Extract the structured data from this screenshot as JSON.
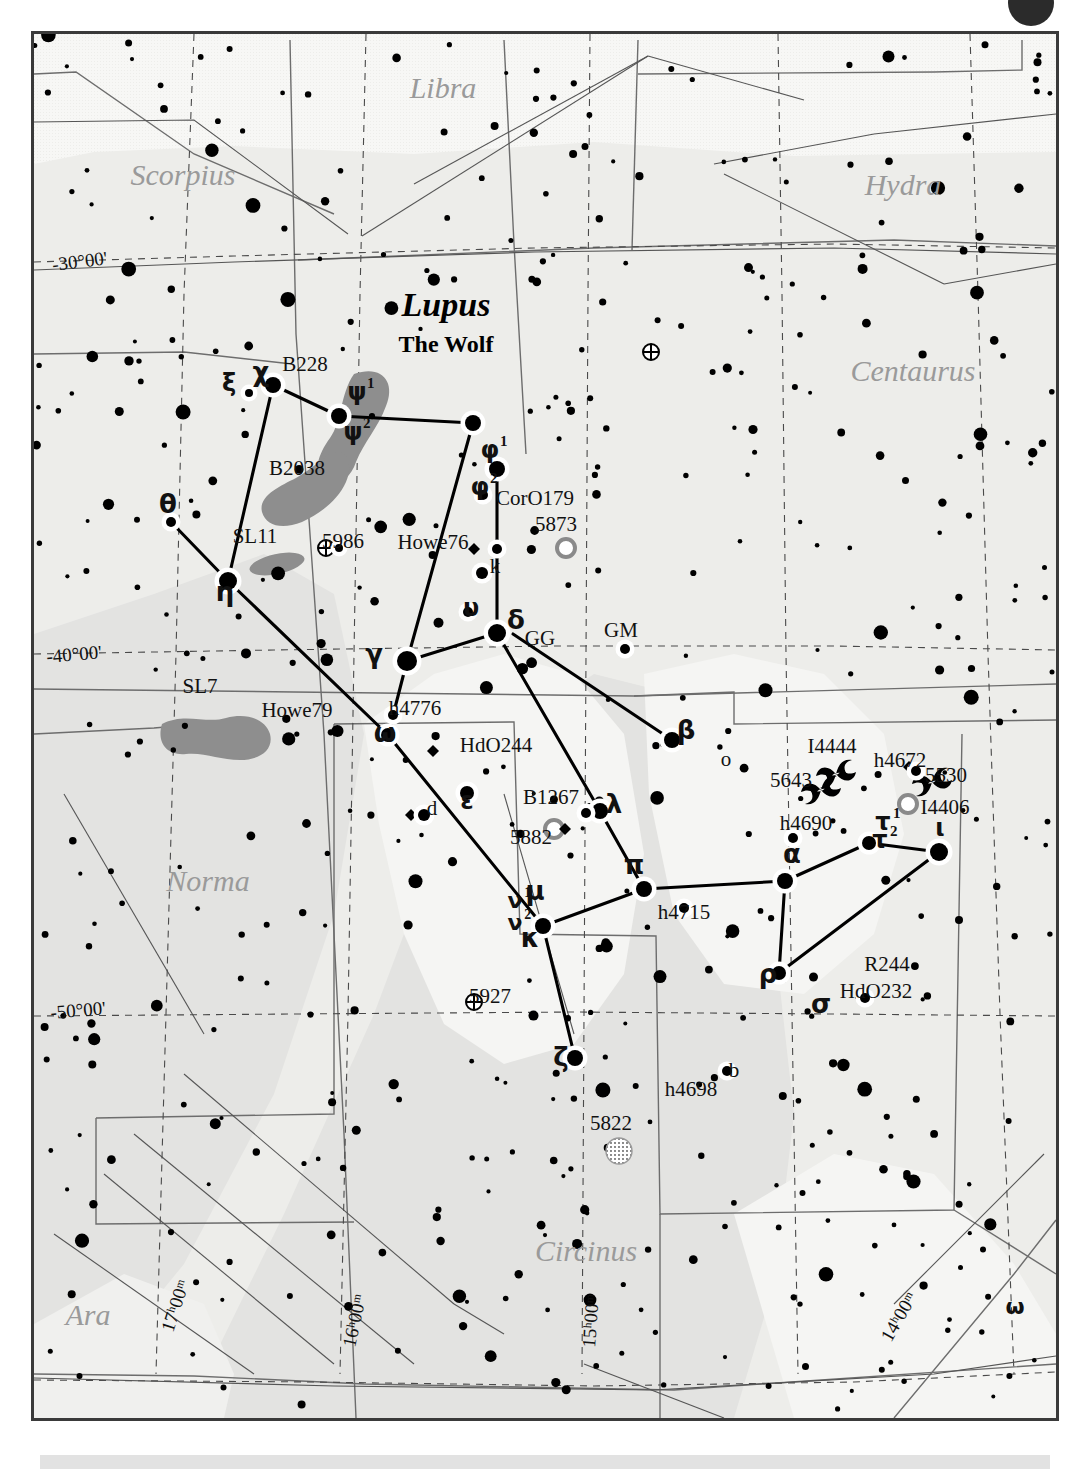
{
  "chart": {
    "title": "Lupus",
    "subtitle": "The Wolf",
    "neighbors": [
      {
        "name": "Libra",
        "x": 440,
        "y": 95,
        "size": 30
      },
      {
        "name": "Scorpius",
        "x": 180,
        "y": 182,
        "size": 30
      },
      {
        "name": "Hydra",
        "x": 900,
        "y": 192,
        "size": 30
      },
      {
        "name": "Centaurus",
        "x": 910,
        "y": 378,
        "size": 30
      },
      {
        "name": "Norma",
        "x": 205,
        "y": 888,
        "size": 30
      },
      {
        "name": "Circinus",
        "x": 583,
        "y": 1258,
        "size": 30
      },
      {
        "name": "Ara",
        "x": 85,
        "y": 1322,
        "size": 30
      },
      {
        "name": "Lupus",
        "x": 0,
        "y": 0,
        "size": 0
      }
    ],
    "coord_labels": [
      {
        "text": "-30°00'",
        "x": 50,
        "y": 268,
        "rot": -7
      },
      {
        "text": "-40°00'",
        "x": 44,
        "y": 660,
        "rot": -5
      },
      {
        "text": "-50°00'",
        "x": 48,
        "y": 1016,
        "rot": -5
      },
      {
        "text": "-60°00'",
        "x": 52,
        "y": 1432,
        "rot": -5
      },
      {
        "text": "17ʰ00ᵐ",
        "x": 170,
        "y": 1330,
        "rot": -72
      },
      {
        "text": "16ʰ00ᵐ",
        "x": 352,
        "y": 1345,
        "rot": -78
      },
      {
        "text": "15ʰ00ᵐ",
        "x": 592,
        "y": 1345,
        "rot": -86
      },
      {
        "text": "14ʰ00ᵐ",
        "x": 888,
        "y": 1340,
        "rot": -60
      }
    ],
    "star_labels": [
      {
        "t": "χ",
        "x": 258,
        "y": 378,
        "k": "g",
        "s": 26
      },
      {
        "t": "ξ",
        "x": 226,
        "y": 388,
        "k": "g",
        "s": 24
      },
      {
        "t": "ψ",
        "x": 354,
        "y": 397,
        "k": "g",
        "s": 24,
        "sup": "1"
      },
      {
        "t": "ψ",
        "x": 350,
        "y": 437,
        "k": "g",
        "s": 24,
        "sup": "2"
      },
      {
        "t": "B228",
        "x": 302,
        "y": 368,
        "k": "t",
        "s": 21
      },
      {
        "t": "B2038",
        "x": 294,
        "y": 472,
        "k": "t",
        "s": 21
      },
      {
        "t": "θ",
        "x": 165,
        "y": 510,
        "k": "g",
        "s": 26
      },
      {
        "t": "SL11",
        "x": 252,
        "y": 540,
        "k": "t",
        "s": 21
      },
      {
        "t": "5986",
        "x": 340,
        "y": 545,
        "k": "t",
        "s": 21
      },
      {
        "t": "η",
        "x": 222,
        "y": 598,
        "k": "g",
        "s": 26
      },
      {
        "t": "SL7",
        "x": 197,
        "y": 690,
        "k": "t",
        "s": 21
      },
      {
        "t": "φ",
        "x": 487,
        "y": 455,
        "k": "g",
        "s": 24,
        "sup": "1"
      },
      {
        "t": "φ",
        "x": 477,
        "y": 492,
        "k": "g",
        "s": 24,
        "sup": "2"
      },
      {
        "t": "CorO179",
        "x": 532,
        "y": 502,
        "k": "t",
        "s": 21
      },
      {
        "t": "5873",
        "x": 553,
        "y": 528,
        "k": "t",
        "s": 21
      },
      {
        "t": "Howe76",
        "x": 430,
        "y": 546,
        "k": "t",
        "s": 21
      },
      {
        "t": "k",
        "x": 492,
        "y": 570,
        "k": "t",
        "s": 21
      },
      {
        "t": "υ",
        "x": 468,
        "y": 613,
        "k": "g",
        "s": 24
      },
      {
        "t": "δ",
        "x": 513,
        "y": 626,
        "k": "g",
        "s": 26
      },
      {
        "t": "GG",
        "x": 537,
        "y": 642,
        "k": "t",
        "s": 21
      },
      {
        "t": "GM",
        "x": 618,
        "y": 634,
        "k": "t",
        "s": 21
      },
      {
        "t": "γ",
        "x": 371,
        "y": 660,
        "k": "g",
        "s": 26
      },
      {
        "t": "h4776",
        "x": 412,
        "y": 712,
        "k": "t",
        "s": 21
      },
      {
        "t": "Howe79",
        "x": 294,
        "y": 714,
        "k": "t",
        "s": 21
      },
      {
        "t": "ω",
        "x": 382,
        "y": 739,
        "k": "g",
        "s": 26
      },
      {
        "t": "β",
        "x": 683,
        "y": 736,
        "k": "g",
        "s": 26
      },
      {
        "t": "o",
        "x": 723,
        "y": 763,
        "k": "t",
        "s": 21
      },
      {
        "t": "HdO244",
        "x": 493,
        "y": 749,
        "k": "t",
        "s": 21
      },
      {
        "t": "I4444",
        "x": 829,
        "y": 750,
        "k": "t",
        "s": 21
      },
      {
        "t": "h4672",
        "x": 897,
        "y": 764,
        "k": "t",
        "s": 21
      },
      {
        "t": "5643",
        "x": 788,
        "y": 784,
        "k": "t",
        "s": 21
      },
      {
        "t": "5530",
        "x": 943,
        "y": 779,
        "k": "t",
        "s": 21
      },
      {
        "t": "I4406",
        "x": 942,
        "y": 811,
        "k": "t",
        "s": 21
      },
      {
        "t": "d",
        "x": 429,
        "y": 812,
        "k": "t",
        "s": 21
      },
      {
        "t": "ε",
        "x": 464,
        "y": 806,
        "k": "g",
        "s": 24
      },
      {
        "t": "B1267",
        "x": 548,
        "y": 801,
        "k": "t",
        "s": 21
      },
      {
        "t": "λ",
        "x": 611,
        "y": 810,
        "k": "g",
        "s": 26
      },
      {
        "t": "τ",
        "x": 880,
        "y": 827,
        "k": "g",
        "s": 24,
        "sup": "1"
      },
      {
        "t": "τ",
        "x": 877,
        "y": 845,
        "k": "g",
        "s": 24,
        "sup": "2"
      },
      {
        "t": "5882",
        "x": 528,
        "y": 841,
        "k": "t",
        "s": 21
      },
      {
        "t": "h4690",
        "x": 803,
        "y": 827,
        "k": "t",
        "s": 21
      },
      {
        "t": "ι",
        "x": 937,
        "y": 833,
        "k": "g",
        "s": 24
      },
      {
        "t": "π",
        "x": 631,
        "y": 871,
        "k": "g",
        "s": 26
      },
      {
        "t": "α",
        "x": 789,
        "y": 860,
        "k": "g",
        "s": 26
      },
      {
        "t": "μ",
        "x": 532,
        "y": 897,
        "k": "g",
        "s": 26
      },
      {
        "t": "ν",
        "x": 512,
        "y": 905,
        "k": "g",
        "s": 22,
        "sup": "1"
      },
      {
        "t": "ν",
        "x": 512,
        "y": 927,
        "k": "g",
        "s": 22,
        "sup": "2"
      },
      {
        "t": "h4715",
        "x": 681,
        "y": 916,
        "k": "t",
        "s": 21
      },
      {
        "t": "κ",
        "x": 527,
        "y": 944,
        "k": "g",
        "s": 26
      },
      {
        "t": "R244",
        "x": 884,
        "y": 968,
        "k": "t",
        "s": 21
      },
      {
        "t": "ρ",
        "x": 765,
        "y": 980,
        "k": "g",
        "s": 26
      },
      {
        "t": "HdO232",
        "x": 873,
        "y": 995,
        "k": "t",
        "s": 21
      },
      {
        "t": "σ",
        "x": 818,
        "y": 1010,
        "k": "g",
        "s": 26
      },
      {
        "t": "5927",
        "x": 487,
        "y": 1000,
        "k": "t",
        "s": 21
      },
      {
        "t": "ζ",
        "x": 558,
        "y": 1063,
        "k": "g",
        "s": 26
      },
      {
        "t": "b",
        "x": 731,
        "y": 1074,
        "k": "t",
        "s": 21
      },
      {
        "t": "h4698",
        "x": 688,
        "y": 1093,
        "k": "t",
        "s": 21
      },
      {
        "t": "5822",
        "x": 608,
        "y": 1127,
        "k": "t",
        "s": 21
      },
      {
        "t": "ω",
        "x": 1012,
        "y": 1311,
        "k": "g",
        "s": 22
      }
    ],
    "constellation_lines": [
      [
        [
          270,
          382
        ],
        [
          336,
          413
        ]
      ],
      [
        [
          336,
          413
        ],
        [
          470,
          420
        ]
      ],
      [
        [
          270,
          382
        ],
        [
          225,
          578
        ]
      ],
      [
        [
          470,
          420
        ],
        [
          404,
          658
        ]
      ],
      [
        [
          494,
          466
        ],
        [
          494,
          630
        ]
      ],
      [
        [
          225,
          578
        ],
        [
          385,
          732
        ]
      ],
      [
        [
          404,
          658
        ],
        [
          494,
          630
        ]
      ],
      [
        [
          404,
          658
        ],
        [
          385,
          732
        ]
      ],
      [
        [
          494,
          630
        ],
        [
          597,
          808
        ]
      ],
      [
        [
          385,
          732
        ],
        [
          540,
          923
        ]
      ],
      [
        [
          597,
          808
        ],
        [
          641,
          886
        ]
      ],
      [
        [
          540,
          923
        ],
        [
          641,
          886
        ]
      ],
      [
        [
          540,
          923
        ],
        [
          572,
          1055
        ]
      ],
      [
        [
          510,
          631
        ],
        [
          669,
          737
        ]
      ],
      [
        [
          641,
          886
        ],
        [
          782,
          878
        ]
      ],
      [
        [
          782,
          878
        ],
        [
          866,
          840
        ]
      ],
      [
        [
          866,
          840
        ],
        [
          936,
          849
        ]
      ],
      [
        [
          936,
          849
        ],
        [
          776,
          970
        ]
      ],
      [
        [
          776,
          970
        ],
        [
          782,
          878
        ]
      ],
      [
        [
          168,
          519
        ],
        [
          225,
          578
        ]
      ]
    ],
    "dso": {
      "globular": [
        {
          "n": "5986",
          "x": 323,
          "y": 545
        },
        {
          "n": "5824",
          "x": 648,
          "y": 349
        },
        {
          "n": "5927",
          "x": 471,
          "y": 999
        }
      ],
      "planetary": [
        {
          "n": "5873",
          "x": 563,
          "y": 545
        },
        {
          "n": "5882",
          "x": 551,
          "y": 826
        },
        {
          "n": "I4406",
          "x": 905,
          "y": 801
        }
      ],
      "open_cluster": [
        {
          "n": "5822",
          "x": 616,
          "y": 1148
        }
      ],
      "galaxy": [
        {
          "n": "I4444",
          "x": 833,
          "y": 771
        },
        {
          "n": "5643",
          "x": 818,
          "y": 787
        },
        {
          "n": "5530",
          "x": 929,
          "y": 779
        }
      ],
      "dark_nebula": [
        "SL7",
        "SL11",
        "B228",
        "B2038"
      ]
    },
    "legend_note": "5824 ⊕"
  }
}
